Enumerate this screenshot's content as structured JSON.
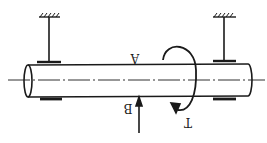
{
  "diagram": {
    "labels": {
      "point_a": "A",
      "point_b": "B",
      "torque": "T"
    },
    "elements": {
      "shaft": "cylindrical-shaft",
      "supports": [
        "left-fixed-support",
        "right-fixed-support"
      ],
      "bearings": [
        "left-bearing",
        "right-bearing"
      ],
      "force_arrow": "force-at-B",
      "torque_arrow": "torque-T"
    },
    "colors": {
      "stroke": "#1a1a1a",
      "background": "#ffffff"
    }
  }
}
